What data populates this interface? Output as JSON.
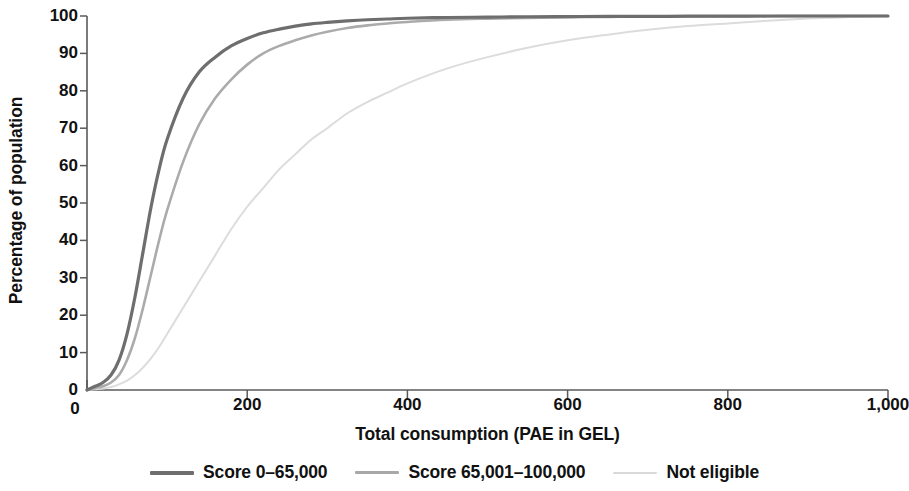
{
  "chart_data": {
    "type": "line",
    "title": "",
    "subtitle": "",
    "xlabel": "Total consumption (PAE in GEL)",
    "ylabel": "Percentage of population",
    "xlim": [
      0,
      1000
    ],
    "ylim": [
      0,
      100
    ],
    "xticks": [
      0,
      200,
      400,
      600,
      800,
      1000
    ],
    "xtick_labels": [
      "0",
      "200",
      "400",
      "600",
      "800",
      "1,000"
    ],
    "yticks": [
      0,
      10,
      20,
      30,
      40,
      50,
      60,
      70,
      80,
      90,
      100
    ],
    "ytick_labels": [
      "0",
      "10",
      "20",
      "30",
      "40",
      "50",
      "60",
      "70",
      "80",
      "90",
      "100"
    ],
    "grid": false,
    "legend_position": "bottom",
    "x": [
      0,
      10,
      20,
      30,
      40,
      50,
      60,
      70,
      80,
      90,
      100,
      120,
      140,
      160,
      180,
      200,
      220,
      240,
      260,
      280,
      300,
      325,
      350,
      375,
      400,
      450,
      500,
      550,
      600,
      650,
      700,
      750,
      800,
      850,
      900,
      950,
      1000
    ],
    "series": [
      {
        "name": "Score 0–65,000",
        "color": "#6e6e6e",
        "width": 3.2,
        "values": [
          0,
          1,
          2,
          4,
          8,
          15,
          25,
          37,
          49,
          59,
          67,
          78,
          85,
          89,
          92,
          94,
          95.5,
          96.5,
          97.3,
          97.9,
          98.3,
          98.7,
          99.0,
          99.2,
          99.4,
          99.6,
          99.7,
          99.8,
          99.85,
          99.9,
          99.9,
          99.95,
          99.95,
          100,
          100,
          100,
          100
        ]
      },
      {
        "name": "Score 65,001–100,000",
        "color": "#ababab",
        "width": 2.6,
        "values": [
          0,
          0.5,
          1,
          2,
          4,
          8,
          14,
          22,
          31,
          40,
          48,
          61,
          71,
          78,
          83,
          87,
          90,
          92,
          93.5,
          94.8,
          95.8,
          96.8,
          97.5,
          98.0,
          98.4,
          99.0,
          99.3,
          99.5,
          99.65,
          99.75,
          99.85,
          99.9,
          99.92,
          99.95,
          100,
          100,
          100
        ]
      },
      {
        "name": "Not eligible",
        "color": "#dcdcdc",
        "width": 2.0,
        "values": [
          0,
          0.2,
          0.4,
          0.8,
          1.5,
          2.5,
          4,
          6,
          8.5,
          11.5,
          15,
          22,
          29,
          36,
          43,
          49,
          54,
          59,
          63,
          67,
          70,
          74,
          77,
          79.5,
          82,
          86,
          89,
          91.5,
          93.5,
          95,
          96.3,
          97.3,
          98.0,
          98.7,
          99.3,
          99.7,
          100
        ]
      }
    ]
  },
  "legend": {
    "items": [
      {
        "label": "Score 0–65,000",
        "color": "#6e6e6e",
        "thickness": 4
      },
      {
        "label": "Score 65,001–100,000",
        "color": "#a8a8a8",
        "thickness": 3
      },
      {
        "label": "Not eligible",
        "color": "#d9d9d9",
        "thickness": 2
      }
    ]
  },
  "axis": {
    "line_color": "#5a5a5a",
    "tick_color": "#5a5a5a"
  }
}
